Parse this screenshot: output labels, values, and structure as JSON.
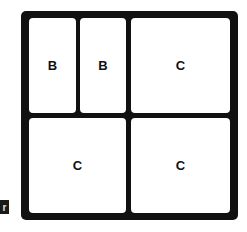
{
  "diagram": {
    "cells": [
      {
        "label": "B",
        "row": 1,
        "position": "top-left-1"
      },
      {
        "label": "B",
        "row": 1,
        "position": "top-left-2"
      },
      {
        "label": "C",
        "row": 1,
        "position": "top-right"
      },
      {
        "label": "C",
        "row": 2,
        "position": "bottom-left"
      },
      {
        "label": "C",
        "row": 2,
        "position": "bottom-right"
      }
    ],
    "corner_tab": {
      "glyph": "r"
    },
    "colors": {
      "frame": "#111111",
      "cell": "#ffffff",
      "text": "#111111"
    }
  }
}
